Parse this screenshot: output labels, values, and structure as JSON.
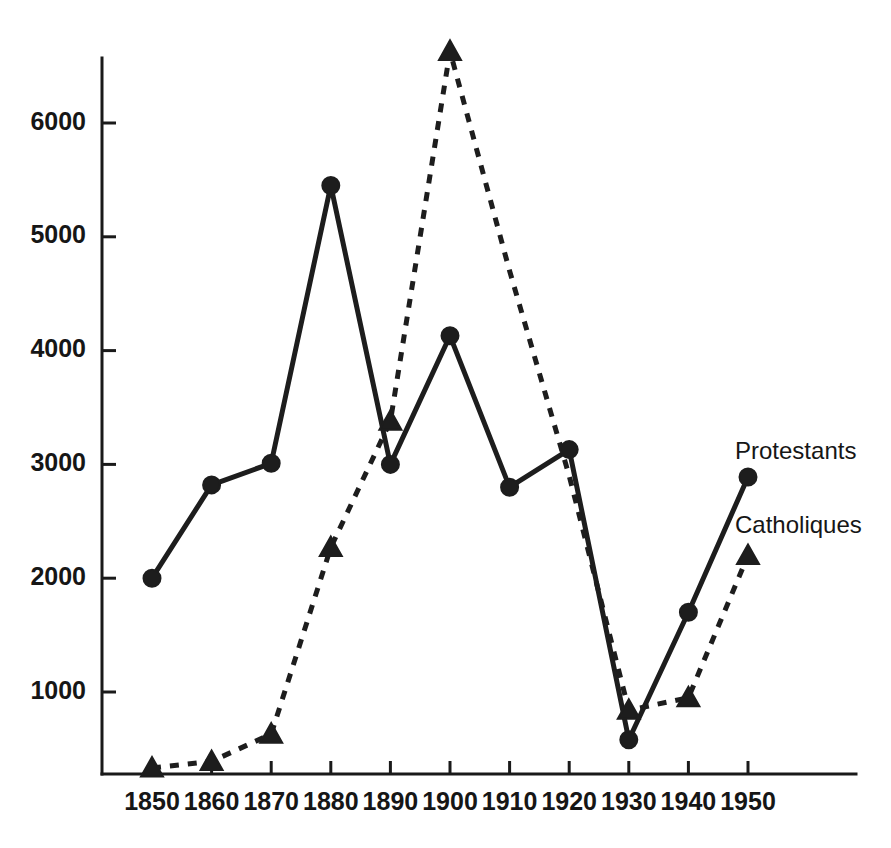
{
  "chart_data": {
    "type": "line",
    "title": "",
    "subtitle": "",
    "xlabel": "",
    "ylabel": "",
    "categories": [
      "1850",
      "1860",
      "1870",
      "1880",
      "1890",
      "1900",
      "1910",
      "1920",
      "1930",
      "1940",
      "1950"
    ],
    "x": [
      1850,
      1860,
      1870,
      1880,
      1890,
      1900,
      1910,
      1920,
      1930,
      1940,
      1950
    ],
    "xlim": [
      1850,
      1950
    ],
    "ylim": [
      0,
      6800
    ],
    "grid": false,
    "legend_position": "inline-right",
    "y_ticks": [
      1000,
      2000,
      3000,
      4000,
      5000,
      6000
    ],
    "y_tick_labels": [
      "1000",
      "2000",
      "3000",
      "4000",
      "5000",
      "6000"
    ],
    "x_tick_labels": [
      "1850",
      "1860",
      "1870",
      "1880",
      "1890",
      "1900",
      "1910",
      "1920",
      "1930",
      "1940",
      "1950"
    ],
    "series": [
      {
        "name": "Protestants",
        "marker": "circle",
        "line_style": "solid",
        "color": "#1d1d1d",
        "values": [
          2000,
          2820,
          3010,
          5450,
          3000,
          4130,
          2800,
          3130,
          580,
          1700,
          2890
        ]
      },
      {
        "name": "Catholiques",
        "marker": "triangle",
        "line_style": "dashed",
        "color": "#1d1d1d",
        "values": [
          150,
          390,
          630,
          2270,
          3380,
          6630,
          4700,
          2900,
          840,
          950,
          2200
        ],
        "marker_visible": [
          true,
          true,
          true,
          true,
          true,
          true,
          false,
          false,
          true,
          true,
          true
        ]
      }
    ],
    "annotations": [
      {
        "text": "Protestants",
        "x": 1950,
        "y": 3100,
        "anchor": "start"
      },
      {
        "text": "Catholiques",
        "x": 1950,
        "y": 2450,
        "anchor": "start"
      }
    ]
  },
  "axis": {
    "y_axis_name": "value-axis",
    "x_axis_name": "year-axis"
  }
}
